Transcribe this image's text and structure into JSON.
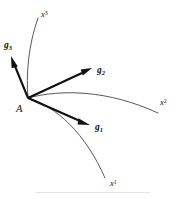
{
  "figure": {
    "name": "curvilinear-coordinate-basis-diagram",
    "width": 176,
    "height": 199,
    "background_color": "#ffffff",
    "curve_color": "#3a3a3a",
    "vector_color": "#111111"
  },
  "point": {
    "label": "A",
    "symbol": "A",
    "x": 28,
    "y": 98
  },
  "basis_vectors": [
    {
      "id": "g1",
      "label_base": "g",
      "label_index": "1",
      "index_type": "subscript",
      "tail": [
        28,
        98
      ],
      "tip": [
        90,
        125
      ],
      "label_x": 95,
      "label_y": 123
    },
    {
      "id": "g2",
      "label_base": "g",
      "label_index": "2",
      "index_type": "subscript",
      "tail": [
        28,
        98
      ],
      "tip": [
        92,
        68
      ],
      "label_x": 97,
      "label_y": 66
    },
    {
      "id": "g3",
      "label_base": "g",
      "label_index": "3",
      "index_type": "subscript",
      "tail": [
        28,
        98
      ],
      "tip": [
        11,
        56
      ],
      "label_x": 4,
      "label_y": 41
    }
  ],
  "coordinate_curves": [
    {
      "id": "x1",
      "label_base": "x",
      "label_index": "1",
      "index_type": "superscript",
      "label_x": 110,
      "label_y": 179
    },
    {
      "id": "x2",
      "label_base": "x",
      "label_index": "2",
      "index_type": "superscript",
      "label_x": 160,
      "label_y": 98
    },
    {
      "id": "x3",
      "label_base": "x",
      "label_index": "3",
      "index_type": "superscript",
      "label_x": 41,
      "label_y": 10
    }
  ]
}
